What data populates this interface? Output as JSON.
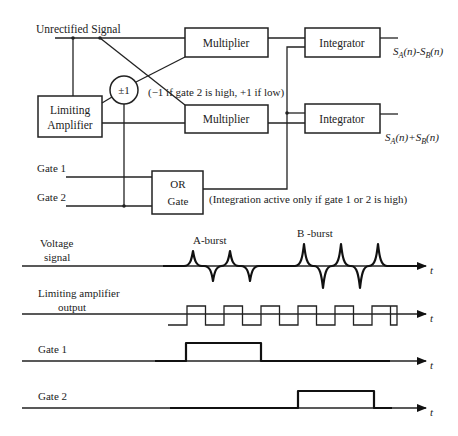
{
  "block_diagram": {
    "input_label": "Unrectified  Signal",
    "limiting_amplifier": [
      "Limiting",
      "Amplifier"
    ],
    "sign_block": "±1",
    "sign_note": "(−1 if gate 2 is high, +1 if low)",
    "multiplier_top": "Multiplier",
    "multiplier_bottom": "Multiplier",
    "integrator_top": "Integrator",
    "integrator_bottom": "Integrator",
    "output_top": "S_A(n)-S_B(n)",
    "output_top_parts": {
      "s1": "S",
      "sub1": "A",
      "mid": "(n)-",
      "s2": "S",
      "sub2": "B",
      "end": "(n)"
    },
    "output_bottom_parts": {
      "s1": "S",
      "sub1": "A",
      "mid": "(n)+",
      "s2": "S",
      "sub2": "B",
      "end": "(n)"
    },
    "gate1_label": "Gate 1",
    "gate2_label": "Gate 2",
    "or_gate": [
      "OR",
      "Gate"
    ],
    "integration_note": "(Integration active only if gate 1 or 2 is high)"
  },
  "timing_diagram": {
    "time_axis_label": "t",
    "voltage_signal_label": [
      "Voltage",
      "signal"
    ],
    "a_burst_label": "A-burst",
    "b_burst_label": "B -burst",
    "limiting_output_label": [
      "Limiting amplifier",
      "output"
    ],
    "gate1_label": "Gate 1",
    "gate2_label": "Gate 2",
    "a_burst_pulses": 2,
    "b_burst_pulses": 3,
    "square_wave_cycles": 6
  }
}
